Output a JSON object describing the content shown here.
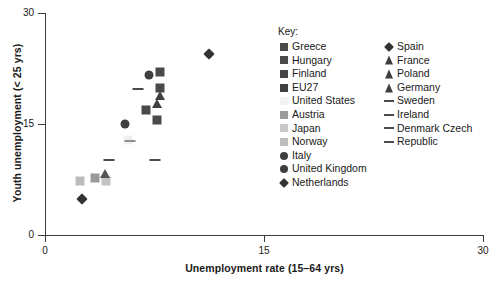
{
  "chart_data": {
    "type": "scatter",
    "title": "",
    "xlabel": "Unemployment rate (15–64 yrs)",
    "ylabel": "Youth unemployment (< 25 yrs)",
    "xlim": [
      0,
      30
    ],
    "ylim": [
      0,
      30
    ],
    "xticks": [
      "0",
      "15",
      "30"
    ],
    "yticks": [
      "0",
      "15",
      "30"
    ],
    "xtick_values": [
      0,
      15,
      30
    ],
    "ytick_values": [
      0,
      15,
      30
    ],
    "grid": false,
    "legend_position": "inside-top-right",
    "legend_title": "Key:",
    "points": [
      {
        "label": "Greece",
        "x": 7.9,
        "y": 22.0,
        "marker": "square",
        "color": "#4a4a4a"
      },
      {
        "label": "Hungary",
        "x": 7.9,
        "y": 19.9,
        "marker": "square",
        "color": "#4a4a4a"
      },
      {
        "label": "Finland",
        "x": 6.9,
        "y": 16.9,
        "marker": "square",
        "color": "#4a4a4a"
      },
      {
        "label": "EU27",
        "x": 7.7,
        "y": 15.5,
        "marker": "square",
        "color": "#4a4a4a"
      },
      {
        "label": "United States",
        "x": 5.7,
        "y": 12.9,
        "marker": "square",
        "color": "#f0f0f0"
      },
      {
        "label": "Austria",
        "x": 3.4,
        "y": 7.7,
        "marker": "square",
        "color": "#9a9a9a"
      },
      {
        "label": "Japan",
        "x": 4.2,
        "y": 7.3,
        "marker": "square",
        "color": "#c4c4c4"
      },
      {
        "label": "Norway",
        "x": 2.4,
        "y": 7.3,
        "marker": "square",
        "color": "#bdbdbd"
      },
      {
        "label": "Italy",
        "x": 7.1,
        "y": 21.6,
        "marker": "circle",
        "color": "#3f3f3f"
      },
      {
        "label": "United Kingdom",
        "x": 5.5,
        "y": 15.0,
        "marker": "circle",
        "color": "#3f3f3f"
      },
      {
        "label": "Netherlands",
        "x": 2.5,
        "y": 4.9,
        "marker": "diamond",
        "color": "#333333"
      },
      {
        "label": "Spain",
        "x": 11.2,
        "y": 24.4,
        "marker": "diamond",
        "color": "#333333"
      },
      {
        "label": "France",
        "x": 4.1,
        "y": 8.2,
        "marker": "triangle",
        "color": "#555555"
      },
      {
        "label": "Poland",
        "x": 7.9,
        "y": 18.8,
        "marker": "triangle",
        "color": "#3f3f3f"
      },
      {
        "label": "Germany",
        "x": 7.7,
        "y": 17.7,
        "marker": "triangle",
        "color": "#3f3f3f"
      },
      {
        "label": "Sweden",
        "x": 6.4,
        "y": 19.7,
        "marker": "dash",
        "color": "#4a4a4a"
      },
      {
        "label": "Ireland",
        "x": 4.4,
        "y": 10.1,
        "marker": "dash",
        "color": "#4a4a4a"
      },
      {
        "label": "Denmark",
        "x": 7.5,
        "y": 10.1,
        "marker": "dash",
        "color": "#4a4a4a"
      },
      {
        "label": "United States dash",
        "x": 5.8,
        "y": 12.7,
        "marker": "dash",
        "color": "#8f8f8f"
      }
    ]
  },
  "legend": {
    "title": "Key:",
    "left_column": [
      {
        "label": "Greece",
        "marker": "square",
        "color": "#4a4a4a"
      },
      {
        "label": "Hungary",
        "marker": "square",
        "color": "#4a4a4a"
      },
      {
        "label": "Finland",
        "marker": "square",
        "color": "#454545"
      },
      {
        "label": "EU27",
        "marker": "square",
        "color": "#3f3f3f"
      },
      {
        "label": "United States",
        "marker": "square",
        "color": "#f2f2f2"
      },
      {
        "label": "Austria",
        "marker": "square",
        "color": "#9a9a9a"
      },
      {
        "label": "Japan",
        "marker": "square",
        "color": "#c9c9c9"
      },
      {
        "label": "Norway",
        "marker": "square",
        "color": "#bdbdbd"
      },
      {
        "label": "Italy",
        "marker": "circle",
        "color": "#3f3f3f"
      },
      {
        "label": "United Kingdom",
        "marker": "circle",
        "color": "#3f3f3f"
      },
      {
        "label": "Netherlands",
        "marker": "diamond",
        "color": "#333333"
      }
    ],
    "right_column": [
      {
        "label": "Spain",
        "marker": "diamond",
        "color": "#333333"
      },
      {
        "label": "France",
        "marker": "triangle",
        "color": "#3f3f3f"
      },
      {
        "label": "Poland",
        "marker": "triangle",
        "color": "#3f3f3f"
      },
      {
        "label": "Germany",
        "marker": "triangle",
        "color": "#3f3f3f"
      },
      {
        "label": "Sweden",
        "marker": "dash",
        "color": "#4a4a4a"
      },
      {
        "label": "Ireland",
        "marker": "dash",
        "color": "#4a4a4a"
      },
      {
        "label": "Denmark Czech",
        "marker": "dash",
        "color": "#4a4a4a"
      },
      {
        "label": "Republic",
        "marker": "dash",
        "color": "#4a4a4a"
      }
    ]
  },
  "axes": {
    "x_title": "Unemployment rate (15–64 yrs)",
    "y_title": "Youth unemployment (< 25 yrs)",
    "x_ticklabels": [
      "0",
      "15",
      "30"
    ],
    "y_ticklabels": [
      "0",
      "15",
      "30"
    ]
  }
}
